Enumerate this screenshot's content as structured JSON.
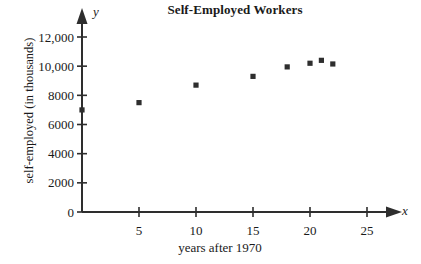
{
  "chart_data": {
    "type": "scatter",
    "title": "Self-Employed Workers",
    "xlabel": "years after 1970",
    "ylabel": "self-employed (in thousands)",
    "x_axis_letter": "x",
    "y_axis_letter": "y",
    "xlim": [
      0,
      27
    ],
    "ylim": [
      0,
      13000
    ],
    "grid": false,
    "legend": "none",
    "x_ticks": [
      5,
      10,
      15,
      20,
      25
    ],
    "x_tick_labels": [
      "5",
      "10",
      "15",
      "20",
      "25"
    ],
    "y_ticks": [
      0,
      2000,
      4000,
      6000,
      8000,
      10000,
      12000
    ],
    "y_tick_labels": [
      "0",
      "2000",
      "4000",
      "6000",
      "8000",
      "10,000",
      "12,000"
    ],
    "marker": "square",
    "marker_color": "#2e2e2e",
    "x": [
      0,
      5,
      10,
      15,
      18,
      20,
      21,
      22
    ],
    "values": [
      7000,
      7500,
      8700,
      9300,
      9950,
      10200,
      10400,
      10150
    ],
    "points": [
      {
        "x": 0,
        "y": 7000
      },
      {
        "x": 5,
        "y": 7500
      },
      {
        "x": 10,
        "y": 8700
      },
      {
        "x": 15,
        "y": 9300
      },
      {
        "x": 18,
        "y": 9950
      },
      {
        "x": 20,
        "y": 10200
      },
      {
        "x": 21,
        "y": 10400
      },
      {
        "x": 22,
        "y": 10150
      }
    ]
  },
  "axis_style": {
    "line_color": "#2e2e2e",
    "arrow_heads": true
  }
}
